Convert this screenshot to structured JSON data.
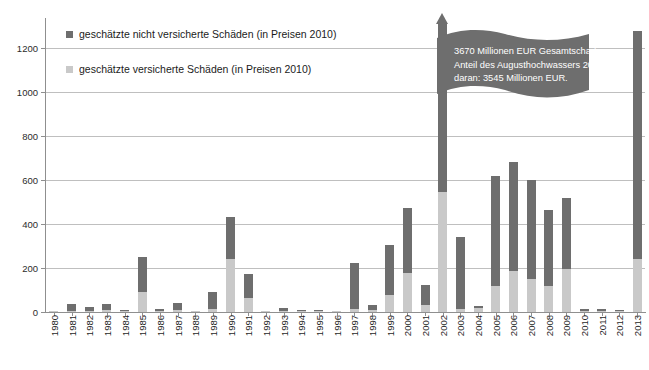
{
  "chart_data": {
    "type": "bar",
    "stacked": true,
    "title": "",
    "subtitle": "",
    "xlabel": "",
    "ylabel": "",
    "ylim": [
      0,
      1300
    ],
    "yticks": [
      0,
      200,
      400,
      600,
      800,
      1000,
      1200
    ],
    "ytick_labels": [
      "0",
      "200",
      "400",
      "600",
      "800",
      "1000",
      "1200"
    ],
    "grid": true,
    "legend_position": "top-left",
    "categories": [
      "1980",
      "1981",
      "1982",
      "1983",
      "1984",
      "1985",
      "1986",
      "1987",
      "1988",
      "1989",
      "1990",
      "1991",
      "1992",
      "1993",
      "1994",
      "1995",
      "1996",
      "1997",
      "1998",
      "1999",
      "2000",
      "2001",
      "2002",
      "2003",
      "2004",
      "2005",
      "2006",
      "2007",
      "2008",
      "2009",
      "2010",
      "2011",
      "2012",
      "2013"
    ],
    "series": [
      {
        "name": "geschätzte versicherte Schäden (in Preisen 2010)",
        "color": "#c9c9c9",
        "values": [
          3,
          6,
          4,
          8,
          3,
          91,
          3,
          7,
          1,
          14,
          241,
          62,
          1,
          6,
          4,
          3,
          2,
          14,
          8,
          76,
          177,
          34,
          545,
          14,
          16,
          120,
          185,
          148,
          120,
          195,
          5,
          6,
          3,
          240
        ]
      },
      {
        "name": "geschätzte nicht versicherte Schäden (in Preisen 2010)",
        "color": "#6e6e6e",
        "values": [
          2,
          32,
          17,
          30,
          7,
          159,
          10,
          33,
          2,
          78,
          189,
          113,
          1,
          14,
          7,
          4,
          4,
          211,
          22,
          229,
          296,
          89,
          3125,
          326,
          10,
          500,
          495,
          452,
          345,
          325,
          8,
          7,
          4,
          1037
        ]
      }
    ],
    "totals": [
      5,
      38,
      21,
      38,
      10,
      250,
      13,
      40,
      3,
      92,
      430,
      175,
      2,
      20,
      11,
      7,
      6,
      225,
      30,
      305,
      473,
      123,
      3670,
      340,
      26,
      620,
      680,
      600,
      465,
      520,
      13,
      13,
      7,
      1277
    ],
    "clipped_bars": [
      {
        "category": "2002",
        "total": 3670,
        "note": "Balken über Achsenmaximum hinaus, mit Pfeilspitze dargestellt"
      }
    ],
    "annotation": {
      "lines": [
        "3670 Millionen EUR Gesamtschaden.",
        "Anteil des Augusthochwassers 2002",
        "daran: 3545 Millionen EUR."
      ],
      "background_color": "#6e6e6e",
      "text_color": "#ffffff"
    }
  },
  "legend": {
    "items": [
      {
        "label": "geschätzte nicht versicherte Schäden (in Preisen 2010)",
        "color": "#6e6e6e"
      },
      {
        "label": "geschätzte versicherte Schäden (in Preisen 2010)",
        "color": "#c9c9c9"
      }
    ]
  }
}
